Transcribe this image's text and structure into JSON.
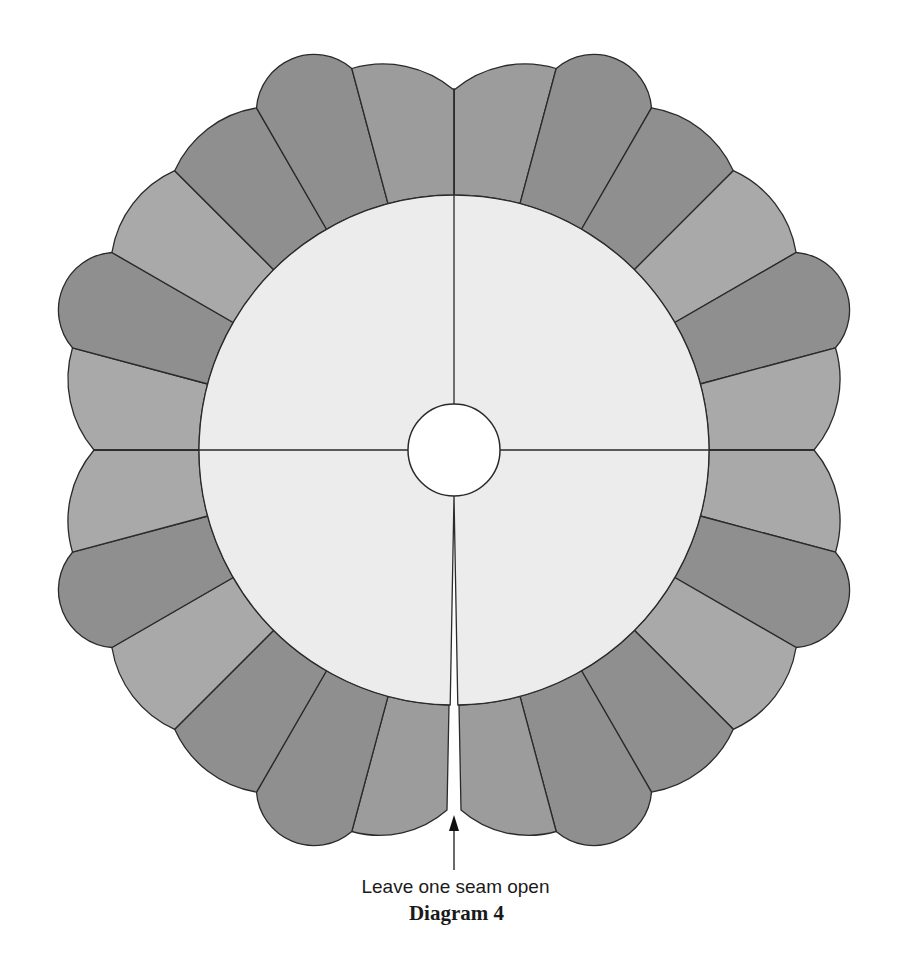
{
  "diagram": {
    "center": [
      454,
      450
    ],
    "inner_circle_radius": 255,
    "hole_radius": 46,
    "seam_radius": 360,
    "side_radius": 395,
    "petal_tip_radius": 428,
    "blade_angle_deg": 15,
    "blades_per_quadrant": 6,
    "open_seam_angle_deg": 90,
    "open_seam_gap_px": 14,
    "colors": {
      "background": "#ffffff",
      "center_ring": "#ececec",
      "hole": "#ffffff",
      "blade_dark": "#8f8f8f",
      "blade_mid": "#9c9c9c",
      "blade_light": "#a9a9a9",
      "outline": "#2a2a2a"
    },
    "quadrant_pattern": [
      {
        "shade": "blade_mid",
        "shape": "arc"
      },
      {
        "shade": "blade_dark",
        "shape": "petal"
      },
      {
        "shade": "blade_dark",
        "shape": "arc"
      },
      {
        "shade": "blade_light",
        "shape": "arc"
      },
      {
        "shade": "blade_dark",
        "shape": "petal"
      },
      {
        "shade": "blade_light",
        "shape": "arc"
      }
    ],
    "quadrant_lines_deg": [
      -90,
      0,
      90,
      180
    ]
  },
  "annotation": {
    "arrow": {
      "x": 454,
      "y_top": 815,
      "y_bottom": 870
    },
    "note": "Leave one seam open",
    "title": "Diagram 4"
  }
}
